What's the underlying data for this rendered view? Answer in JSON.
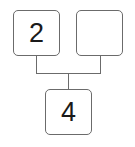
{
  "diagram": {
    "type": "number-bond",
    "top_left": {
      "value": "2"
    },
    "top_right": {
      "value": ""
    },
    "bottom": {
      "value": "4"
    },
    "line_color": "#6b6b6b"
  }
}
